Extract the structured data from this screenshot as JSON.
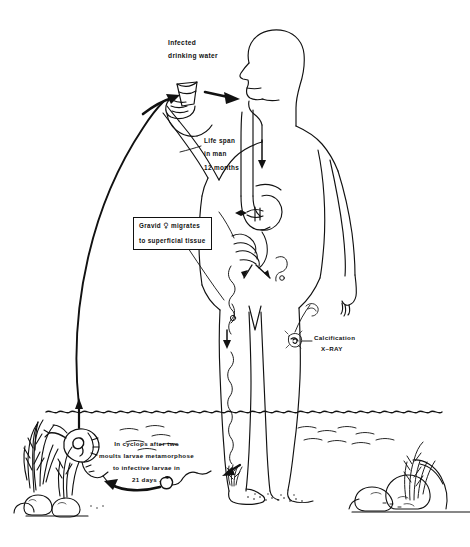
{
  "figure": {
    "background_color": "#ffffff",
    "ink_color": "#111111"
  },
  "labels": {
    "infected_water": {
      "line1": "Infected",
      "line2": "drinking water"
    },
    "life_span": {
      "line1": "Life  span",
      "line2": "in  man",
      "line3": "12  months"
    },
    "gravid_female": {
      "line1_prefix": "Gravid",
      "line1_symbol": "♀",
      "line1_suffix": "migrates",
      "line2": "to superficial tissue"
    },
    "calcification": {
      "line1": "Calcification",
      "line2": "X–RAY"
    },
    "cyclops": {
      "line1": "In  cyclops  after  two",
      "line2": "moults  larvae  metamorphose",
      "line3": "to  infective  larvae  in",
      "line4": "21  days ."
    }
  },
  "scene_elements": {
    "human_figure": "standing-man-silhouette",
    "cup": "drinking-cup",
    "water_surface": "wavy-waterline",
    "cyclops": "copepod-with-larva",
    "plants": "aquatic-vegetation",
    "rocks": "shoreline-rocks",
    "worm_in_leg": "guinea-worm-in-leg",
    "intestines": "intestinal-tract",
    "blister": "skin-blister"
  }
}
